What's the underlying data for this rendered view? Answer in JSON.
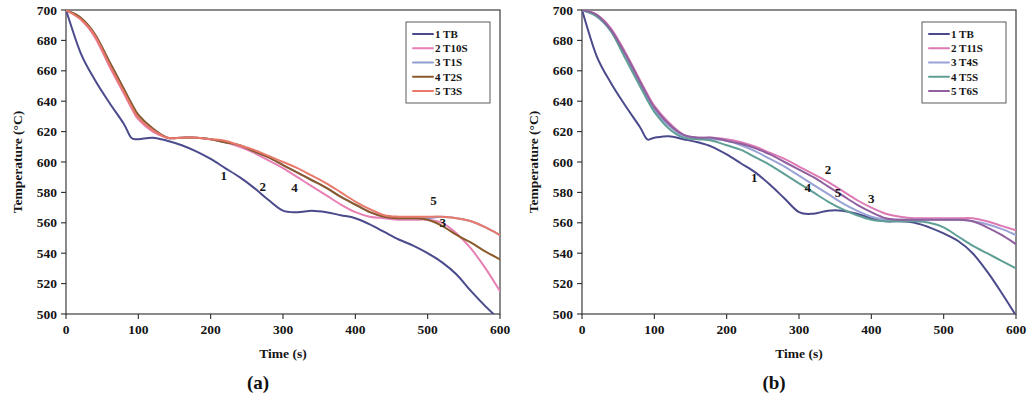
{
  "figure": {
    "panels": [
      {
        "caption": "(a)",
        "axes": {
          "xlabel": "Time (s)",
          "ylabel": "Temperature (°C)",
          "xticks": [
            "0",
            "100",
            "200",
            "300",
            "400",
            "500",
            "600"
          ],
          "yticks": [
            "500",
            "520",
            "540",
            "560",
            "580",
            "600",
            "620",
            "640",
            "660",
            "680",
            "700"
          ]
        },
        "legend": [
          {
            "label": "1 TB",
            "color": "#4a4a8c"
          },
          {
            "label": "2 T10S",
            "color": "#e87fb5"
          },
          {
            "label": "3 T1S",
            "color": "#8f9fd4"
          },
          {
            "label": "4 T2S",
            "color": "#8a5a2b"
          },
          {
            "label": "5 T3S",
            "color": "#e8796b"
          }
        ],
        "curve_labels": [
          {
            "text": "1",
            "x": 218,
            "y": 588
          },
          {
            "text": "2",
            "x": 272,
            "y": 581
          },
          {
            "text": "4",
            "x": 316,
            "y": 580
          },
          {
            "text": "5",
            "x": 508,
            "y": 572
          },
          {
            "text": "3",
            "x": 521,
            "y": 557
          }
        ]
      },
      {
        "caption": "(b)",
        "axes": {
          "xlabel": "Time (s)",
          "ylabel": "Temperature (°C)",
          "xticks": [
            "0",
            "100",
            "200",
            "300",
            "400",
            "500",
            "600"
          ],
          "yticks": [
            "500",
            "520",
            "540",
            "560",
            "580",
            "600",
            "620",
            "640",
            "660",
            "680",
            "700"
          ]
        },
        "legend": [
          {
            "label": "1 TB",
            "color": "#4a4a8c"
          },
          {
            "label": "2 T11S",
            "color": "#dd7ab4"
          },
          {
            "label": "3 T4S",
            "color": "#9aa2d6"
          },
          {
            "label": "4 T5S",
            "color": "#5f9f96"
          },
          {
            "label": "5 T6S",
            "color": "#8f5f9e"
          }
        ],
        "curve_labels": [
          {
            "text": "1",
            "x": 238,
            "y": 587
          },
          {
            "text": "2",
            "x": 340,
            "y": 592
          },
          {
            "text": "4",
            "x": 312,
            "y": 580
          },
          {
            "text": "5",
            "x": 354,
            "y": 577
          },
          {
            "text": "3",
            "x": 400,
            "y": 573
          }
        ]
      }
    ]
  },
  "chart_data": [
    {
      "type": "line",
      "panel": "(a)",
      "title": "",
      "xlabel": "Time (s)",
      "ylabel": "Temperature (°C)",
      "xlim": [
        0,
        600
      ],
      "ylim": [
        500,
        700
      ],
      "xtick_step": 100,
      "ytick_step": 20,
      "grid": false,
      "legend_position": "top-right",
      "x": [
        0,
        20,
        40,
        60,
        80,
        90,
        100,
        120,
        140,
        160,
        180,
        200,
        220,
        240,
        260,
        280,
        300,
        320,
        340,
        360,
        380,
        400,
        420,
        440,
        460,
        480,
        500,
        520,
        540,
        560,
        580,
        600
      ],
      "series": [
        {
          "name": "1 TB",
          "color": "#4a4a8c",
          "values": [
            700,
            672,
            654,
            639,
            625,
            616,
            615,
            616,
            614,
            611,
            607,
            602,
            596,
            590,
            583,
            575,
            568,
            567,
            568,
            567,
            565,
            563,
            559,
            554,
            549,
            545,
            540,
            534,
            526,
            515,
            505,
            496
          ]
        },
        {
          "name": "2 T10S",
          "color": "#e87fb5",
          "values": [
            700,
            694,
            682,
            663,
            645,
            636,
            628,
            620,
            616,
            616,
            616,
            615,
            613,
            610,
            606,
            601,
            596,
            590,
            584,
            578,
            572,
            567,
            564,
            563,
            562,
            562,
            562,
            560,
            553,
            543,
            530,
            515
          ]
        },
        {
          "name": "3 T1S",
          "color": "#8f9fd4",
          "values": [
            700,
            695,
            684,
            666,
            648,
            639,
            631,
            622,
            616,
            616,
            616,
            615,
            613,
            611,
            607,
            603,
            598,
            593,
            588,
            583,
            577,
            572,
            567,
            564,
            563,
            563,
            563,
            564,
            563,
            561,
            557,
            552
          ]
        },
        {
          "name": "4 T2S",
          "color": "#8a5a2b",
          "values": [
            700,
            695,
            684,
            666,
            648,
            639,
            631,
            622,
            616,
            616,
            616,
            615,
            613,
            611,
            607,
            603,
            598,
            593,
            588,
            583,
            577,
            572,
            567,
            564,
            563,
            563,
            562,
            558,
            552,
            547,
            541,
            536
          ]
        },
        {
          "name": "5 T3S",
          "color": "#e8796b",
          "values": [
            700,
            694,
            683,
            664,
            646,
            637,
            629,
            621,
            616,
            616,
            616,
            615,
            614,
            611,
            608,
            604,
            600,
            596,
            591,
            586,
            580,
            574,
            569,
            565,
            564,
            564,
            564,
            564,
            563,
            561,
            557,
            552
          ]
        }
      ]
    },
    {
      "type": "line",
      "panel": "(b)",
      "title": "",
      "xlabel": "Time (s)",
      "ylabel": "Temperature (°C)",
      "xlim": [
        0,
        600
      ],
      "ylim": [
        500,
        700
      ],
      "xtick_step": 100,
      "ytick_step": 20,
      "grid": false,
      "legend_position": "top-right",
      "x": [
        0,
        20,
        40,
        60,
        80,
        90,
        100,
        120,
        140,
        160,
        180,
        200,
        220,
        240,
        260,
        280,
        300,
        320,
        340,
        360,
        380,
        400,
        420,
        440,
        460,
        480,
        500,
        520,
        540,
        560,
        580,
        600
      ],
      "series": [
        {
          "name": "1 TB",
          "color": "#4a4a8c",
          "values": [
            700,
            670,
            652,
            637,
            623,
            615,
            616,
            617,
            615,
            613,
            610,
            605,
            599,
            593,
            585,
            576,
            567,
            566,
            568,
            568,
            566,
            563,
            561,
            561,
            560,
            557,
            553,
            548,
            540,
            528,
            514,
            499
          ]
        },
        {
          "name": "2 T11S",
          "color": "#dd7ab4",
          "values": [
            700,
            697,
            688,
            672,
            654,
            645,
            637,
            626,
            618,
            616,
            616,
            615,
            613,
            610,
            606,
            602,
            597,
            592,
            587,
            581,
            575,
            570,
            566,
            564,
            563,
            563,
            563,
            563,
            563,
            561,
            558,
            555
          ]
        },
        {
          "name": "3 T4S",
          "color": "#9aa2d6",
          "values": [
            700,
            696,
            686,
            669,
            651,
            642,
            634,
            624,
            617,
            616,
            615,
            614,
            611,
            607,
            602,
            597,
            591,
            585,
            579,
            573,
            568,
            564,
            562,
            562,
            562,
            562,
            562,
            562,
            561,
            559,
            556,
            552
          ]
        },
        {
          "name": "4 T5S",
          "color": "#5f9f96",
          "values": [
            700,
            696,
            686,
            668,
            650,
            641,
            633,
            622,
            616,
            615,
            614,
            611,
            608,
            603,
            598,
            592,
            586,
            580,
            574,
            569,
            565,
            562,
            561,
            561,
            561,
            560,
            557,
            551,
            545,
            540,
            535,
            530
          ]
        },
        {
          "name": "5 T6S",
          "color": "#8f5f9e",
          "values": [
            700,
            697,
            687,
            671,
            653,
            644,
            636,
            625,
            618,
            616,
            616,
            614,
            612,
            609,
            605,
            600,
            595,
            590,
            584,
            578,
            572,
            567,
            563,
            562,
            562,
            562,
            562,
            562,
            561,
            557,
            552,
            546
          ]
        }
      ]
    }
  ]
}
